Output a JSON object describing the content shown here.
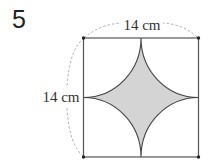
{
  "problem": {
    "number": "5"
  },
  "figure": {
    "shape": "square",
    "side_length": "14 cm",
    "top_label": "14 cm",
    "left_label": "14 cm",
    "colors": {
      "outline": "#444444",
      "shade": "#d4d4d4",
      "dashed": "#9a9a9a"
    }
  }
}
